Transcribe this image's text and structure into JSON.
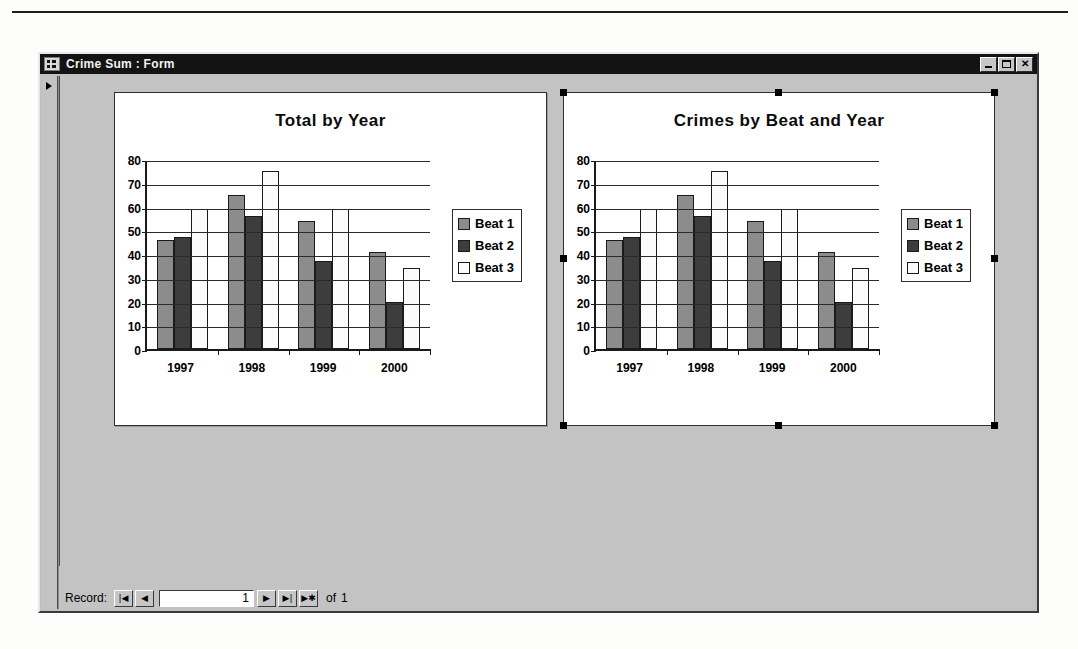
{
  "window": {
    "title": "Crime Sum : Form",
    "icon": "form-icon",
    "buttons": {
      "minimize": "minimize-button",
      "maximize": "maximize-button",
      "close": "✕"
    }
  },
  "record_nav": {
    "label": "Record:",
    "first": "|◀",
    "previous": "◀",
    "value": "1",
    "next": "▶",
    "last": "▶|",
    "new": "▶✱",
    "of_label": "of",
    "total": "1"
  },
  "charts": [
    {
      "id": "chart-total-by-year",
      "selected": false,
      "chart_data": {
        "type": "bar",
        "title": "Total by Year",
        "xlabel": "",
        "ylabel": "",
        "categories": [
          "1997",
          "1998",
          "1999",
          "2000"
        ],
        "series": [
          {
            "name": "Beat 1",
            "color": "#8c8c8c",
            "values": [
              46,
              65,
              54,
              41
            ]
          },
          {
            "name": "Beat 2",
            "color": "#3d3d3d",
            "values": [
              47,
              56,
              37,
              20
            ]
          },
          {
            "name": "Beat 3",
            "color": "#fbfbfb",
            "values": [
              59,
              75,
              59,
              34
            ]
          }
        ],
        "ylim": [
          0,
          80
        ],
        "yticks": [
          0,
          10,
          20,
          30,
          40,
          50,
          60,
          70,
          80
        ],
        "grid": true,
        "legend_position": "right"
      }
    },
    {
      "id": "chart-crimes-by-beat-and-year",
      "selected": true,
      "chart_data": {
        "type": "bar",
        "title": "Crimes by Beat and Year",
        "xlabel": "",
        "ylabel": "",
        "categories": [
          "1997",
          "1998",
          "1999",
          "2000"
        ],
        "series": [
          {
            "name": "Beat 1",
            "color": "#8c8c8c",
            "values": [
              46,
              65,
              54,
              41
            ]
          },
          {
            "name": "Beat 2",
            "color": "#3d3d3d",
            "values": [
              47,
              56,
              37,
              20
            ]
          },
          {
            "name": "Beat 3",
            "color": "#fbfbfb",
            "values": [
              59,
              75,
              59,
              34
            ]
          }
        ],
        "ylim": [
          0,
          80
        ],
        "yticks": [
          0,
          10,
          20,
          30,
          40,
          50,
          60,
          70,
          80
        ],
        "grid": true,
        "legend_position": "right"
      }
    }
  ]
}
